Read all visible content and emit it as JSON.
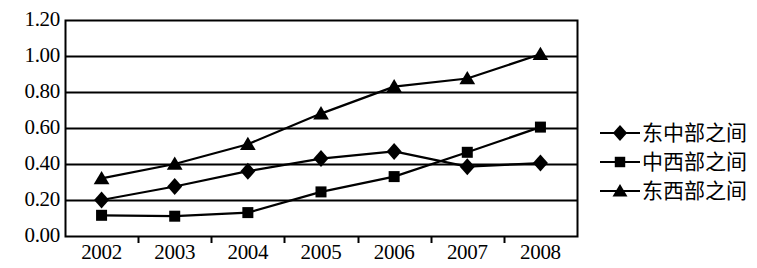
{
  "chart_data": {
    "type": "line",
    "title": "",
    "subtitle": "",
    "xlabel": "",
    "ylabel": "",
    "categories": [
      "2002",
      "2003",
      "2004",
      "2005",
      "2006",
      "2007",
      "2008"
    ],
    "ylim": [
      0.0,
      1.2
    ],
    "ytick_labels": [
      "1.20",
      "1.00",
      "0.80",
      "0.60",
      "0.40",
      "0.20",
      "0.00"
    ],
    "ytick_values": [
      1.2,
      1.0,
      0.8,
      0.6,
      0.4,
      0.2,
      0.0
    ],
    "grid": true,
    "grid_axis": "y",
    "legend_position": "right",
    "series": [
      {
        "name": "东中部之间",
        "marker": "diamond",
        "color": "#000000",
        "values": [
          0.2,
          0.275,
          0.36,
          0.43,
          0.47,
          0.385,
          0.405
        ]
      },
      {
        "name": "中西部之间",
        "marker": "square",
        "color": "#000000",
        "values": [
          0.115,
          0.11,
          0.13,
          0.245,
          0.33,
          0.465,
          0.605
        ]
      },
      {
        "name": "东西部之间",
        "marker": "triangle",
        "color": "#000000",
        "values": [
          0.32,
          0.4,
          0.51,
          0.68,
          0.83,
          0.875,
          1.01
        ]
      }
    ]
  },
  "legend": {
    "items": [
      {
        "label": "东中部之间",
        "marker": "diamond-marker-icon"
      },
      {
        "label": "中西部之间",
        "marker": "square-marker-icon"
      },
      {
        "label": "东西部之间",
        "marker": "triangle-marker-icon"
      }
    ]
  },
  "axes": {
    "y_labels": [
      "1.20",
      "1.00",
      "0.80",
      "0.60",
      "0.40",
      "0.20",
      "0.00"
    ],
    "x_labels": [
      "2002",
      "2003",
      "2004",
      "2005",
      "2006",
      "2007",
      "2008"
    ]
  }
}
